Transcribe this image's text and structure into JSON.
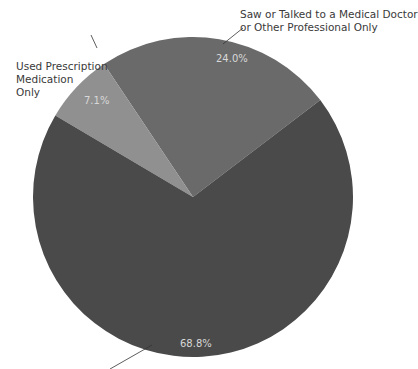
{
  "chart_data": {
    "type": "pie",
    "title": "",
    "slices": [
      {
        "label": "Saw or Talked to a Medical Doctor or Other Professional Only",
        "value": 24.0,
        "display": "24.0%",
        "color": "#6a6a6a"
      },
      {
        "label": "Used Prescription Medication Only",
        "value": 7.1,
        "display": "7.1%",
        "color": "#909090"
      },
      {
        "label": "",
        "value": 68.8,
        "display": "68.8%",
        "color": "#4a4a4a"
      }
    ],
    "legend": "none"
  },
  "labels": {
    "doctor_line1": "Saw or Talked to a Medical Doctor",
    "doctor_line2": "or Other Professional Only",
    "rx_line1": "Used Prescription",
    "rx_line2": "Medication",
    "rx_line3": "Only",
    "pct_doctor": "24.0%",
    "pct_rx": "7.1%",
    "pct_other": "68.8%"
  }
}
